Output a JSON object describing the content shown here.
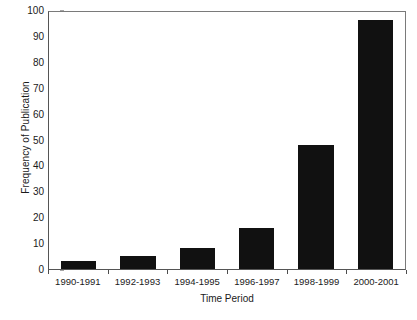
{
  "chart_data": {
    "type": "bar",
    "title": "",
    "xlabel": "Time Period",
    "ylabel": "Frequency of Publication",
    "categories": [
      "1990-1991",
      "1992-1993",
      "1994-1995",
      "1996-1997",
      "1998-1999",
      "2000-2001"
    ],
    "values": [
      3,
      5,
      8,
      16,
      48,
      96
    ],
    "ylim": [
      0,
      100
    ],
    "yticks": [
      0,
      10,
      20,
      30,
      40,
      50,
      60,
      70,
      80,
      90,
      100
    ],
    "ytick_labels": [
      "0",
      "10",
      "20",
      "30",
      "40",
      "50",
      "60",
      "70",
      "80",
      "90",
      "100"
    ],
    "grid": false,
    "legend": null,
    "bar_color": "#111111",
    "axis_color": "#555555",
    "background": "#ffffff"
  }
}
